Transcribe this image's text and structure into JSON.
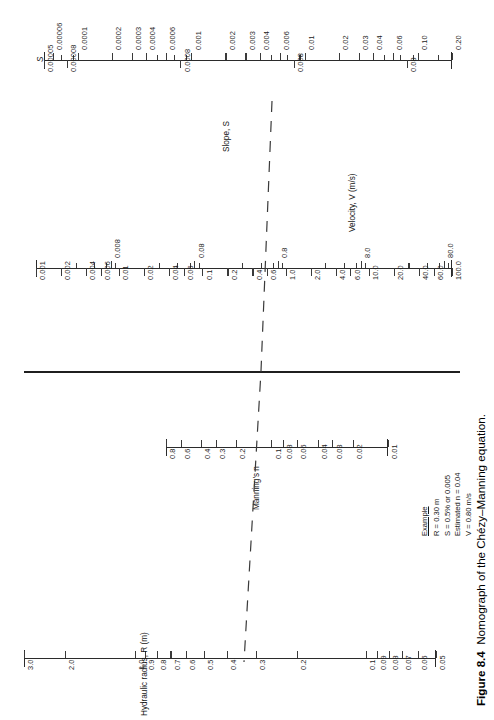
{
  "figure": {
    "number": "Figure 8.4",
    "caption": "Nomograph of the Chézy–Manning equation."
  },
  "scales": {
    "slope": {
      "symbol": "S",
      "title": "Slope, S",
      "title_italic_part": "S",
      "labels_above": [
        "0.00006",
        "0.0001",
        "0.0002",
        "0.0003",
        "0.0004",
        "0.0006",
        "0.001",
        "0.002",
        "0.003",
        "0.004",
        "0.006",
        "0.01",
        "0.02",
        "0.03",
        "0.04",
        "0.06",
        "0.10",
        "0.20"
      ],
      "labels_below": [
        "0.00005",
        "0.00008",
        "0.0008",
        "0.008",
        "0.08"
      ],
      "range": [
        "0.00005",
        "0.20"
      ]
    },
    "velocity": {
      "title": "Velocity, V   (m/s)",
      "title_italic_part": "V",
      "labels_below": [
        "0.001",
        "0.002",
        "0.004",
        "0.006",
        "0.01",
        "0.02",
        "0.04",
        "0.06",
        "0.1",
        "0.2",
        "0.4",
        "0.6",
        "1.0",
        "2.0",
        "4.0",
        "6.0",
        "10.0",
        "20.0",
        "40.0",
        "60.0",
        "100.0"
      ],
      "labels_above": [
        "0.008",
        "0.08",
        "0.8",
        "8.0",
        "80.0"
      ],
      "range": [
        "0.001",
        "100.0"
      ]
    },
    "manning": {
      "title": "Manning's n",
      "title_italic_part": "n",
      "labels_below": [
        "0.8",
        "0.6",
        "0.4",
        "0.3",
        "0.2",
        "0.1",
        "0.08",
        "0.06",
        "0.04",
        "0.03",
        "0.02",
        "0.01"
      ],
      "range": [
        "0.8",
        "0.01"
      ]
    },
    "radius": {
      "title": "Hydraulic radius, R   (m)",
      "title_italic_part": "R",
      "labels_below": [
        "3.0",
        "2.0",
        "1.0",
        "0.9",
        "0.8",
        "0.7",
        "0.6",
        "0.5",
        "0.4",
        "0.3",
        "0.2",
        "0.1",
        "0.09",
        "0.08",
        "0.07",
        "0.06",
        "0.05"
      ],
      "range": [
        "3.0",
        "0.05"
      ]
    }
  },
  "example": {
    "heading": "Example",
    "lines": [
      "R = 0.30 m",
      "S = 0.5% or 0.005",
      "Estimated n = 0.04",
      "V = 0.80 m/s"
    ],
    "values": {
      "R": "0.30 m",
      "S": "0.5% or 0.005",
      "n": "0.04",
      "V": "0.80 m/s"
    }
  },
  "colors": {
    "line": "#2b2b2b",
    "text": "#1a1a1a",
    "background": "#ffffff"
  }
}
